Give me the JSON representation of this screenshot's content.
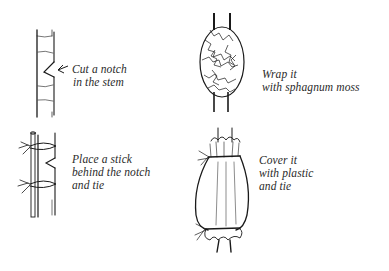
{
  "diagram": {
    "type": "instructional-illustration",
    "colors": {
      "ink": "#1a1a1a",
      "text": "#2a2a2a",
      "background": "#ffffff"
    },
    "steps": [
      {
        "id": 1,
        "illustration": "stem-with-notch",
        "lines": [
          "Cut a notch",
          "in the stem"
        ]
      },
      {
        "id": 2,
        "illustration": "stem-with-stick-tied",
        "lines": [
          "Place a stick",
          "behind the notch",
          "and tie"
        ]
      },
      {
        "id": 3,
        "illustration": "stem-wrapped-in-moss",
        "lines": [
          "Wrap it",
          "with sphagnum moss"
        ]
      },
      {
        "id": 4,
        "illustration": "stem-covered-in-plastic",
        "lines": [
          "Cover it",
          "with plastic",
          "and tie"
        ]
      }
    ]
  }
}
